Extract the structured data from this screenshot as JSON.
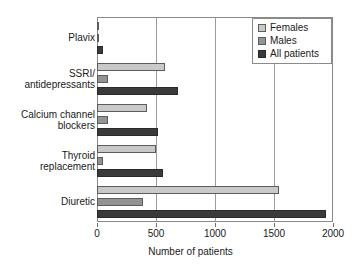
{
  "chart_data": {
    "type": "bar",
    "orientation": "horizontal",
    "title": "",
    "xlabel": "Number of patients",
    "ylabel": "",
    "xlim": [
      0,
      2000
    ],
    "xticks": [
      0,
      500,
      1000,
      1500,
      2000
    ],
    "grid": true,
    "legend_position": "top-right",
    "categories": [
      "Plavix",
      "SSRI/\nantidepressants",
      "Calcium channel\nblockers",
      "Thyroid\nreplacement",
      "Diuretic"
    ],
    "series": [
      {
        "name": "Females",
        "color": "#c9c9c9",
        "values": [
          20,
          580,
          420,
          500,
          1540
        ]
      },
      {
        "name": "Males",
        "color": "#939393",
        "values": [
          15,
          90,
          90,
          50,
          390
        ]
      },
      {
        "name": "All patients",
        "color": "#3a3a3a",
        "values": [
          55,
          690,
          520,
          560,
          1940
        ]
      }
    ]
  },
  "axis": {
    "x_title": "Number of patients",
    "tick_labels": [
      "0",
      "500",
      "1000",
      "1500",
      "2000"
    ]
  },
  "legend": {
    "items": [
      {
        "label": "Females"
      },
      {
        "label": "Males"
      },
      {
        "label": "All patients"
      }
    ]
  }
}
